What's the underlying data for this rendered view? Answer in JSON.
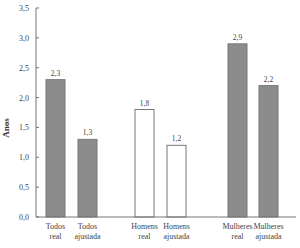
{
  "chart_data": {
    "type": "bar",
    "title": "",
    "xlabel": "",
    "ylabel": "Anos",
    "ylim": [
      0,
      3.5
    ],
    "yticks": [
      "0,0",
      "0,5",
      "1,0",
      "1,5",
      "2,0",
      "2,5",
      "3,0",
      "3,5"
    ],
    "grid": false,
    "legend": null,
    "categories": [
      [
        "Todos",
        "real"
      ],
      [
        "Todos",
        "ajustada"
      ],
      [
        "Homens",
        "real"
      ],
      [
        "Homens",
        "ajustada"
      ],
      [
        "Mulheres",
        "real"
      ],
      [
        "Mulheres",
        "ajustada"
      ]
    ],
    "values": [
      2.3,
      1.3,
      1.8,
      1.2,
      2.9,
      2.2
    ],
    "value_labels": [
      "2,3",
      "1,3",
      "1,8",
      "1,2",
      "2,9",
      "2,2"
    ],
    "groups": [
      {
        "name": "Todos",
        "fill": "#8c8c8c"
      },
      {
        "name": "Homens",
        "fill": "#ffffff"
      },
      {
        "name": "Mulheres",
        "fill": "#8c8c8c"
      }
    ]
  },
  "colors": {
    "bar_filled": "#8c8c8c",
    "bar_empty": "#ffffff",
    "bar_stroke": "#777777",
    "axis": "#777777"
  }
}
